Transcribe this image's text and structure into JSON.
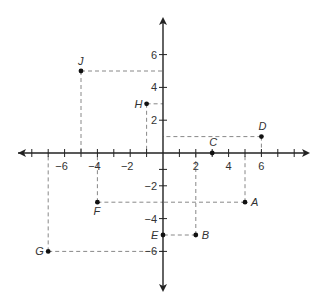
{
  "chart_data": {
    "type": "scatter",
    "title": "",
    "xlabel": "",
    "ylabel": "",
    "xlim": [
      -8.5,
      8.5
    ],
    "ylim": [
      -8,
      8.5
    ],
    "grid": false,
    "x_tick_labels": [
      "-6",
      "-4",
      "-2",
      "2",
      "4",
      "6"
    ],
    "y_tick_labels": [
      "6",
      "4",
      "2",
      "-2",
      "-4",
      "-6"
    ],
    "points": [
      {
        "label": "A",
        "x": 5,
        "y": -3
      },
      {
        "label": "B",
        "x": 2,
        "y": -5
      },
      {
        "label": "C",
        "x": 3,
        "y": 0
      },
      {
        "label": "D",
        "x": 6,
        "y": 1
      },
      {
        "label": "E",
        "x": 0,
        "y": -5
      },
      {
        "label": "F",
        "x": -4,
        "y": -3
      },
      {
        "label": "G",
        "x": -7,
        "y": -6
      },
      {
        "label": "H",
        "x": -1,
        "y": 3
      },
      {
        "label": "J",
        "x": -5,
        "y": 5
      }
    ],
    "projection_lines": "dashed lines from each point to both axes"
  },
  "colors": {
    "axis": "#222222",
    "dashed": "#888888",
    "point": "#111111"
  }
}
